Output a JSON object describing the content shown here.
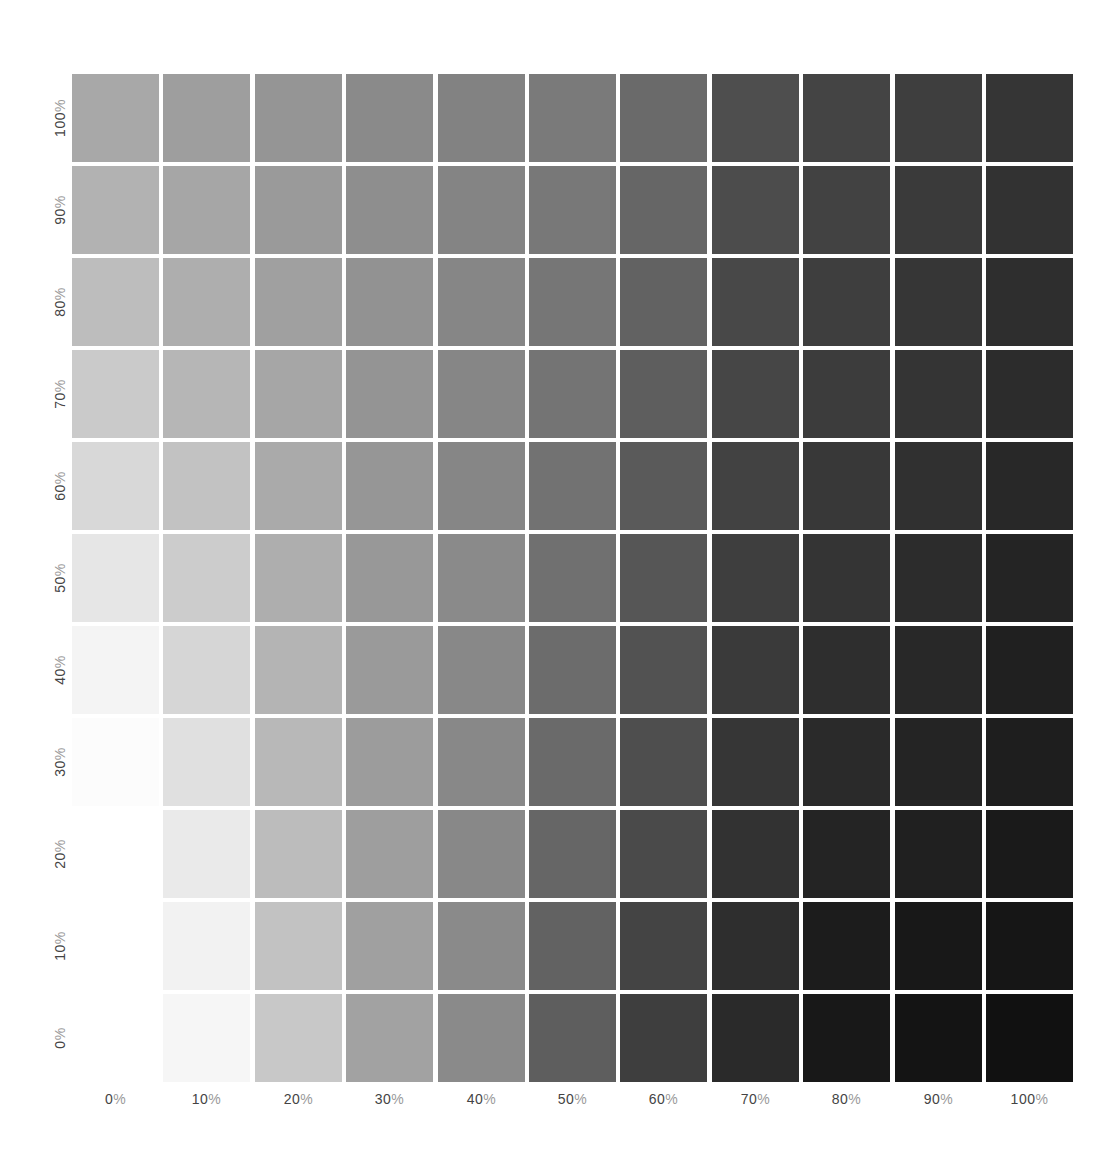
{
  "chart_data": {
    "type": "heatmap",
    "title": "",
    "xlabel": "",
    "ylabel": "",
    "x_ticks": [
      "0%",
      "10%",
      "20%",
      "30%",
      "40%",
      "50%",
      "60%",
      "70%",
      "80%",
      "90%",
      "100%"
    ],
    "y_ticks_top_to_bottom": [
      "100%",
      "90%",
      "80%",
      "70%",
      "60%",
      "50%",
      "40%",
      "30%",
      "20%",
      "10%",
      "0%"
    ],
    "grid": false,
    "legend": "none",
    "value_encoding": "gray level (hex) of each swatch, rows top-to-bottom, columns left-to-right",
    "cells": [
      [
        "#a8a8a8",
        "#9e9e9e",
        "#959595",
        "#8a8a8a",
        "#828282",
        "#7a7a7a",
        "#6a6a6a",
        "#4e4e4e",
        "#444444",
        "#3e3e3e",
        "#353535"
      ],
      [
        "#b2b2b2",
        "#a6a6a6",
        "#9a9a9a",
        "#8e8e8e",
        "#848484",
        "#787878",
        "#666666",
        "#4c4c4c",
        "#424242",
        "#3a3a3a",
        "#323232"
      ],
      [
        "#bdbdbd",
        "#aeaeae",
        "#a0a0a0",
        "#929292",
        "#868686",
        "#767676",
        "#626262",
        "#484848",
        "#3e3e3e",
        "#363636",
        "#2e2e2e"
      ],
      [
        "#cacaca",
        "#b6b6b6",
        "#a6a6a6",
        "#949494",
        "#868686",
        "#747474",
        "#5e5e5e",
        "#464646",
        "#3c3c3c",
        "#343434",
        "#2c2c2c"
      ],
      [
        "#d8d8d8",
        "#c2c2c2",
        "#aaaaaa",
        "#969696",
        "#868686",
        "#727272",
        "#5a5a5a",
        "#424242",
        "#383838",
        "#303030",
        "#282828"
      ],
      [
        "#e6e6e6",
        "#cccccc",
        "#aeaeae",
        "#989898",
        "#8a8a8a",
        "#707070",
        "#565656",
        "#3e3e3e",
        "#343434",
        "#2c2c2c",
        "#242424"
      ],
      [
        "#f4f4f4",
        "#d6d6d6",
        "#b4b4b4",
        "#9a9a9a",
        "#888888",
        "#6c6c6c",
        "#525252",
        "#3a3a3a",
        "#2e2e2e",
        "#282828",
        "#202020"
      ],
      [
        "#fcfcfc",
        "#e0e0e0",
        "#b8b8b8",
        "#9c9c9c",
        "#888888",
        "#6a6a6a",
        "#4e4e4e",
        "#363636",
        "#2a2a2a",
        "#242424",
        "#1e1e1e"
      ],
      [
        "#ffffff",
        "#eaeaea",
        "#bcbcbc",
        "#9e9e9e",
        "#888888",
        "#666666",
        "#4a4a4a",
        "#323232",
        "#242424",
        "#202020",
        "#1a1a1a"
      ],
      [
        "#ffffff",
        "#f2f2f2",
        "#c2c2c2",
        "#a0a0a0",
        "#8a8a8a",
        "#626262",
        "#444444",
        "#2e2e2e",
        "#1c1c1c",
        "#181818",
        "#161616"
      ],
      [
        "#ffffff",
        "#f6f6f6",
        "#c8c8c8",
        "#a2a2a2",
        "#8a8a8a",
        "#5e5e5e",
        "#3e3e3e",
        "#2a2a2a",
        "#181818",
        "#141414",
        "#111111"
      ]
    ]
  },
  "labels": {
    "x": [
      {
        "num": "0",
        "pct": "%"
      },
      {
        "num": "10",
        "pct": "%"
      },
      {
        "num": "20",
        "pct": "%"
      },
      {
        "num": "30",
        "pct": "%"
      },
      {
        "num": "40",
        "pct": "%"
      },
      {
        "num": "50",
        "pct": "%"
      },
      {
        "num": "60",
        "pct": "%"
      },
      {
        "num": "70",
        "pct": "%"
      },
      {
        "num": "80",
        "pct": "%"
      },
      {
        "num": "90",
        "pct": "%"
      },
      {
        "num": "100",
        "pct": "%"
      }
    ],
    "y": [
      {
        "num": "100",
        "pct": "%"
      },
      {
        "num": "90",
        "pct": "%"
      },
      {
        "num": "80",
        "pct": "%"
      },
      {
        "num": "70",
        "pct": "%"
      },
      {
        "num": "60",
        "pct": "%"
      },
      {
        "num": "50",
        "pct": "%"
      },
      {
        "num": "40",
        "pct": "%"
      },
      {
        "num": "30",
        "pct": "%"
      },
      {
        "num": "20",
        "pct": "%"
      },
      {
        "num": "10",
        "pct": "%"
      },
      {
        "num": "0",
        "pct": "%"
      }
    ]
  },
  "colors": {
    "background": "#ffffff",
    "label_number": "#444444",
    "label_percent": "#9a9a9a"
  }
}
